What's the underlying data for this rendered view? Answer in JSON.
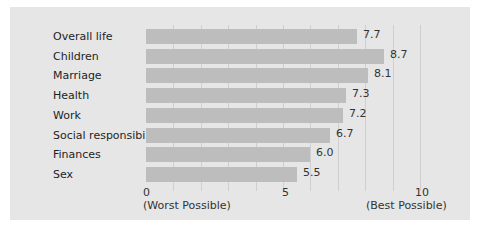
{
  "chart_data": {
    "type": "bar",
    "orientation": "horizontal",
    "title": "",
    "xlabel": "",
    "ylabel": "",
    "categories": [
      "Overall life",
      "Children",
      "Marriage",
      "Health",
      "Work",
      "Social responsibility",
      "Finances",
      "Sex"
    ],
    "values": [
      7.7,
      8.7,
      8.1,
      7.3,
      7.2,
      6.7,
      6.0,
      5.5
    ],
    "value_labels": [
      "7.7",
      "8.7",
      "8.1",
      "7.3",
      "7.2",
      "6.7",
      "6.0",
      "5.5"
    ],
    "xlim": [
      0,
      10
    ],
    "x_ticks": [
      "0",
      "5",
      "10"
    ],
    "x_tick_sublabels": [
      "(Worst Possible)",
      "",
      "(Best Possible)"
    ],
    "grid": true,
    "grid_interval": 1,
    "legend": null,
    "colors": {
      "bar": "#bdbdbd",
      "background": "#e6e6e6",
      "grid": "#cfcfcf"
    }
  }
}
